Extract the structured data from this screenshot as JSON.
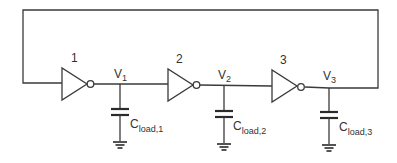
{
  "diagram": {
    "type": "ring-oscillator-schematic",
    "colors": {
      "line": "#3a3a3a",
      "background": "#ffffff",
      "text": "#333333"
    },
    "inverters": [
      {
        "id": "1",
        "label": "1"
      },
      {
        "id": "2",
        "label": "2"
      },
      {
        "id": "3",
        "label": "3"
      }
    ],
    "nodes": [
      {
        "id": "V1",
        "main": "V",
        "sub": "1"
      },
      {
        "id": "V2",
        "main": "V",
        "sub": "2"
      },
      {
        "id": "V3",
        "main": "V",
        "sub": "3"
      }
    ],
    "capacitors": [
      {
        "id": "Cload1",
        "main": "C",
        "sub": "load,1"
      },
      {
        "id": "Cload2",
        "main": "C",
        "sub": "load,2"
      },
      {
        "id": "Cload3",
        "main": "C",
        "sub": "load,3"
      }
    ],
    "feedback": "output V3 connected back to input of inverter 1"
  }
}
